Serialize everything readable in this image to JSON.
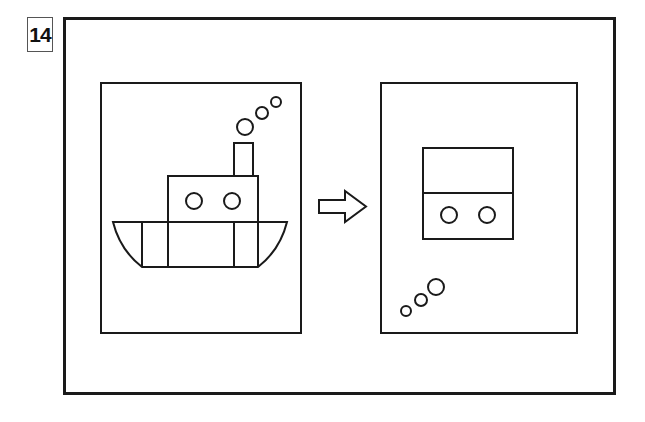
{
  "problem": {
    "number": "14"
  },
  "colors": {
    "stroke": "#1a1a1a",
    "background": "#ffffff"
  },
  "figure": {
    "left_panel": {
      "subject": "boat",
      "parts": [
        "hull",
        "cabin",
        "portholes",
        "chimney",
        "smoke-puffs"
      ],
      "porthole_count": 2,
      "smoke_puff_count": 3
    },
    "arrow": {
      "direction": "right",
      "icon": "outline-arrow-right"
    },
    "right_panel": {
      "subject": "cabin-fragment",
      "parts": [
        "box-with-divider",
        "portholes",
        "bubbles"
      ],
      "porthole_count": 2,
      "bubble_count": 3
    }
  }
}
